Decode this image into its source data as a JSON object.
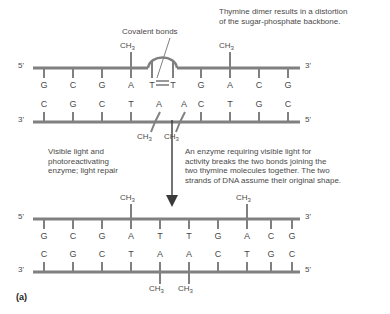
{
  "figure": {
    "panel_label": "(a)",
    "annotations": {
      "covalent_bonds": "Covalent bonds",
      "distortion_note": "Thymine dimer results in a distortion\nof the sugar-phosphate backbone.",
      "left_process": "Visible light and\nphotoreactivating\nenzyme; light repair",
      "right_process": "An enzyme requiring visible light for\nactivity breaks the two bonds joining the\ntwo thymine molecules together. The two\nstrands of DNA assume their original shape."
    },
    "methyl_label": "CH",
    "methyl_subscript": "3",
    "end_5": "5'",
    "end_3": "3'",
    "damaged_dna": {
      "top_strand": {
        "left_end": "5'",
        "right_end": "3'",
        "bases": [
          "G",
          "C",
          "G",
          "A",
          "T",
          "T",
          "G",
          "A",
          "C",
          "G"
        ],
        "methyl_on_indices": [
          3,
          7
        ],
        "dimer_indices": [
          4,
          5
        ]
      },
      "bottom_strand": {
        "left_end": "3'",
        "right_end": "5'",
        "bases": [
          "C",
          "G",
          "C",
          "T",
          "A",
          "A",
          "C",
          "T",
          "G",
          "C"
        ],
        "methyl_on_indices": [
          4,
          5
        ]
      }
    },
    "repaired_dna": {
      "top_strand": {
        "left_end": "5'",
        "right_end": "3'",
        "bases": [
          "G",
          "C",
          "G",
          "A",
          "T",
          "T",
          "G",
          "A",
          "C",
          "G"
        ],
        "methyl_on_indices": [
          3,
          7
        ]
      },
      "bottom_strand": {
        "left_end": "3'",
        "right_end": "5'",
        "bases": [
          "C",
          "G",
          "C",
          "T",
          "A",
          "A",
          "C",
          "T",
          "G",
          "C"
        ],
        "methyl_on_indices": [
          4,
          5
        ]
      }
    },
    "colors": {
      "backbone": "#808080",
      "text": "#4a4a4a",
      "arrow": "#3a3a3a"
    }
  }
}
